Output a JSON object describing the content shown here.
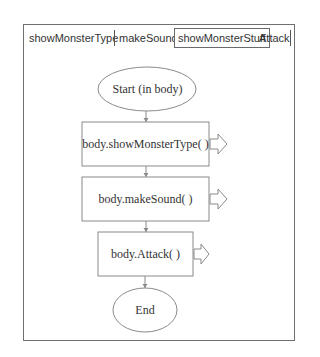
{
  "tabs": [
    {
      "label": "showMonsterType",
      "active": false
    },
    {
      "label": "makeSound",
      "active": false
    },
    {
      "label": "showMonsterStuff",
      "active": true
    },
    {
      "label": "Attack",
      "active": false
    }
  ],
  "flowchart": {
    "start": "Start (in body)",
    "steps": [
      "body.showMonsterType( )",
      "body.makeSound( )",
      "body.Attack( )"
    ],
    "end": "End"
  },
  "colors": {
    "frame": "#707070",
    "shape_stroke": "#8a8a8a",
    "text": "#333333"
  }
}
